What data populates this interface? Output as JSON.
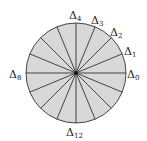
{
  "diagram": {
    "type": "circle-sectors",
    "sector_count": 16,
    "center": [
      76,
      73
    ],
    "radius": 50,
    "fill_color": "#d8d8d8",
    "line_color": "#333333",
    "labels": [
      {
        "id": "delta0",
        "base": "Δ",
        "sub": "0",
        "x": 127,
        "y": 78
      },
      {
        "id": "delta1",
        "base": "Δ",
        "sub": "1",
        "x": 124,
        "y": 55
      },
      {
        "id": "delta2",
        "base": "Δ",
        "sub": "2",
        "x": 110,
        "y": 36
      },
      {
        "id": "delta3",
        "base": "Δ",
        "sub": "3",
        "x": 91,
        "y": 24
      },
      {
        "id": "delta4",
        "base": "Δ",
        "sub": "4",
        "x": 69,
        "y": 19
      },
      {
        "id": "delta8",
        "base": "Δ",
        "sub": "8",
        "x": 9,
        "y": 78
      },
      {
        "id": "delta12",
        "base": "Δ",
        "sub": "12",
        "x": 66,
        "y": 136
      }
    ]
  }
}
